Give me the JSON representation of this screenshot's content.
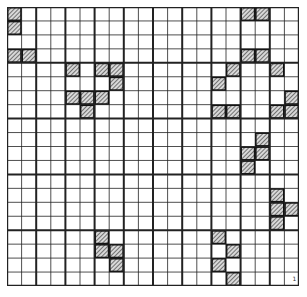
{
  "diagram": {
    "type": "hatched-cell-grid",
    "columns": 20,
    "rows": 20,
    "thick_line_every_columns": 2,
    "thick_line_every_rows": 4,
    "colors": {
      "background": "#ffffff",
      "grid_line": "#222222",
      "hatch_fill": "#9a9a9a",
      "hatch_stroke": "#444444"
    },
    "hatched_cells": [
      [
        0,
        0
      ],
      [
        0,
        1
      ],
      [
        0,
        3
      ],
      [
        1,
        3
      ],
      [
        16,
        0
      ],
      [
        17,
        0
      ],
      [
        16,
        3
      ],
      [
        17,
        3
      ],
      [
        4,
        4
      ],
      [
        6,
        4
      ],
      [
        7,
        4
      ],
      [
        7,
        5
      ],
      [
        4,
        6
      ],
      [
        5,
        6
      ],
      [
        6,
        6
      ],
      [
        5,
        7
      ],
      [
        15,
        4
      ],
      [
        18,
        4
      ],
      [
        14,
        5
      ],
      [
        19,
        6
      ],
      [
        14,
        7
      ],
      [
        15,
        7
      ],
      [
        18,
        7
      ],
      [
        19,
        7
      ],
      [
        17,
        9
      ],
      [
        16,
        10
      ],
      [
        17,
        10
      ],
      [
        16,
        11
      ],
      [
        18,
        13
      ],
      [
        18,
        14
      ],
      [
        19,
        14
      ],
      [
        18,
        15
      ],
      [
        6,
        16
      ],
      [
        6,
        17
      ],
      [
        7,
        17
      ],
      [
        7,
        18
      ],
      [
        14,
        16
      ],
      [
        15,
        17
      ],
      [
        14,
        18
      ],
      [
        15,
        19
      ]
    ],
    "corner_mark": {
      "text": "1",
      "column": 19,
      "row": 19
    }
  }
}
